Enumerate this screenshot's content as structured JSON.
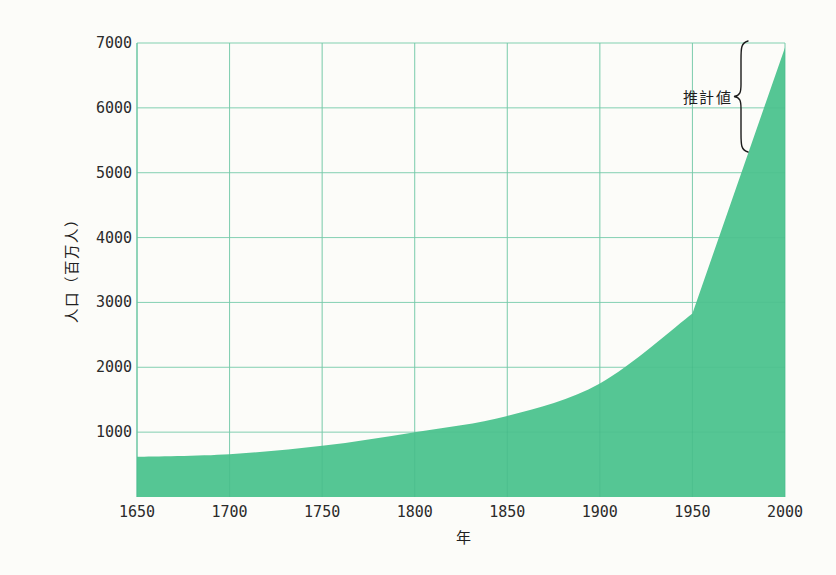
{
  "chart_data": {
    "type": "area",
    "title": "",
    "x": [
      1650,
      1700,
      1750,
      1800,
      1850,
      1900,
      1950,
      2000
    ],
    "values": [
      620,
      660,
      790,
      1000,
      1250,
      1750,
      2830,
      6930
    ],
    "xlabel": "年",
    "ylabel": "人口（百万人）",
    "xlim": [
      1650,
      2000
    ],
    "ylim": [
      0,
      7000
    ],
    "x_ticks": [
      "1650",
      "1700",
      "1750",
      "1800",
      "1850",
      "1900",
      "1950",
      "2000"
    ],
    "y_ticks": [
      "1000",
      "2000",
      "3000",
      "4000",
      "5000",
      "6000",
      "7000"
    ],
    "grid": "on",
    "legend": "none",
    "annotation": {
      "label": "推計値"
    },
    "colors": {
      "area_fill": "#55c694",
      "grid": "#8fd6ba",
      "axis": "#7bcfae",
      "tick_text": "#2b2b2b",
      "annotation_text": "#1c1c1c",
      "brace": "#1c1c1c",
      "background": "#fcfcf9"
    }
  }
}
